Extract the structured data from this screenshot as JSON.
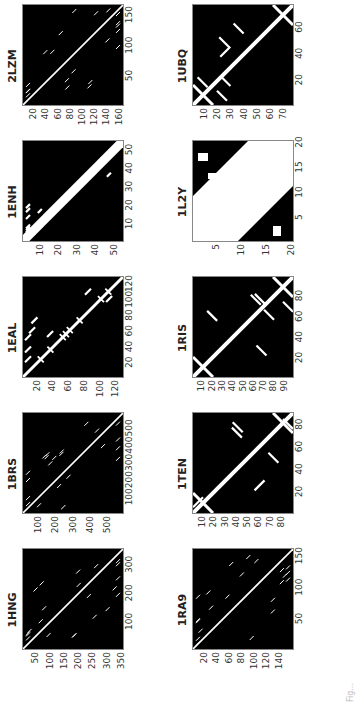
{
  "figure": {
    "caption": "Fig...",
    "panels": [
      {
        "id": "1HNG",
        "n": 350,
        "xticks": [
          "100",
          "200",
          "300"
        ],
        "yticks": [
          "50",
          "100",
          "150",
          "200",
          "250",
          "300",
          "350"
        ],
        "style": "sparse"
      },
      {
        "id": "1BRS",
        "n": 580,
        "xticks": [
          "100",
          "200",
          "300",
          "400",
          "500"
        ],
        "yticks": [
          "100",
          "200",
          "300",
          "400",
          "500"
        ],
        "style": "sparse"
      },
      {
        "id": "1EAL",
        "n": 127,
        "xticks": [
          "20",
          "40",
          "60",
          "80",
          "100",
          "120"
        ],
        "yticks": [
          "20",
          "40",
          "60",
          "80",
          "100",
          "120"
        ],
        "style": "helix"
      },
      {
        "id": "1ENH",
        "n": 54,
        "xticks": [
          "10",
          "20",
          "30",
          "40",
          "50"
        ],
        "yticks": [
          "10",
          "20",
          "30",
          "40",
          "50"
        ],
        "style": "thick"
      },
      {
        "id": "2LZM",
        "n": 164,
        "xticks": [
          "50",
          "100",
          "150"
        ],
        "yticks": [
          "20",
          "40",
          "60",
          "80",
          "100",
          "120",
          "140",
          "160"
        ],
        "style": "sparse"
      },
      {
        "id": "1RA9",
        "n": 159,
        "xticks": [
          "50",
          "100",
          "150"
        ],
        "yticks": [
          "20",
          "40",
          "60",
          "80",
          "100",
          "120",
          "140"
        ],
        "style": "sparse"
      },
      {
        "id": "1TEN",
        "n": 89,
        "xticks": [
          "20",
          "40",
          "60",
          "80"
        ],
        "yticks": [
          "10",
          "20",
          "30",
          "40",
          "50",
          "60",
          "70",
          "80"
        ],
        "style": "sheet"
      },
      {
        "id": "1RIS",
        "n": 97,
        "xticks": [
          "20",
          "40",
          "60",
          "80"
        ],
        "yticks": [
          "10",
          "20",
          "30",
          "40",
          "50",
          "60",
          "70",
          "80",
          "90"
        ],
        "style": "sheet"
      },
      {
        "id": "1L2Y",
        "n": 20,
        "xticks": [
          "5",
          "10",
          "15",
          "20"
        ],
        "yticks": [
          "5",
          "10",
          "15",
          "20"
        ],
        "style": "block"
      },
      {
        "id": "1UBQ",
        "n": 76,
        "xticks": [
          "20",
          "40",
          "60"
        ],
        "yticks": [
          "10",
          "20",
          "30",
          "40",
          "50",
          "60",
          "70"
        ],
        "style": "sheet"
      }
    ]
  }
}
